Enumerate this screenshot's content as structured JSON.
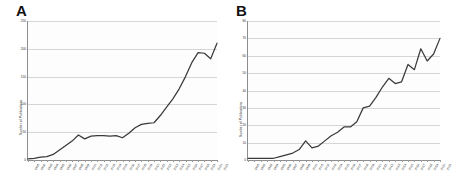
{
  "figure": {
    "panels": [
      {
        "label": "A",
        "name": "panel-a",
        "chart": {
          "type": "line",
          "title": "A",
          "xlabel": "",
          "ylabel": "Number of Publications",
          "ylim": [
            0,
            250
          ],
          "yticks": [
            0,
            50,
            100,
            150,
            200,
            250
          ],
          "ytick_labels": [
            "0",
            "50",
            "100",
            "150",
            "200",
            "250"
          ],
          "grid": true,
          "legend": "none",
          "categories": [
            "1991",
            "1992",
            "1993",
            "1994",
            "1995",
            "1996",
            "1997",
            "1998",
            "1999",
            "2000",
            "2001",
            "2002",
            "2003",
            "2004",
            "2005",
            "2006",
            "2007",
            "2008",
            "2009",
            "2010",
            "2011",
            "2012",
            "2013",
            "2014",
            "2015",
            "2016",
            "2017",
            "2018",
            "2019",
            "2020",
            "2021"
          ],
          "values": [
            2,
            3,
            5,
            6,
            10,
            18,
            26,
            34,
            45,
            38,
            43,
            44,
            44,
            43,
            44,
            40,
            48,
            58,
            64,
            66,
            67,
            80,
            95,
            110,
            128,
            150,
            175,
            193,
            192,
            182,
            210
          ]
        }
      },
      {
        "label": "B",
        "name": "panel-b",
        "chart": {
          "type": "line",
          "title": "B",
          "xlabel": "",
          "ylabel": "Number of Publications",
          "ylim": [
            0,
            80
          ],
          "yticks": [
            0,
            10,
            20,
            30,
            40,
            50,
            60,
            70,
            80
          ],
          "ytick_labels": [
            "0",
            "10",
            "20",
            "30",
            "40",
            "50",
            "60",
            "70",
            "80"
          ],
          "grid": true,
          "legend": "none",
          "categories": [
            "1991",
            "1992",
            "1993",
            "1994",
            "1995",
            "1996",
            "1997",
            "1998",
            "1999",
            "2000",
            "2001",
            "2002",
            "2003",
            "2004",
            "2005",
            "2006",
            "2007",
            "2008",
            "2009",
            "2010",
            "2011",
            "2012",
            "2013",
            "2014",
            "2015",
            "2016",
            "2017",
            "2018",
            "2019",
            "2020",
            "2021"
          ],
          "values": [
            1,
            1,
            1,
            1,
            1,
            2,
            3,
            4,
            6,
            11,
            7,
            8,
            11,
            14,
            16,
            19,
            19,
            22,
            30,
            31,
            36,
            42,
            47,
            44,
            45,
            55,
            52,
            64,
            57,
            61,
            70
          ]
        }
      }
    ]
  },
  "chart_data": [
    {
      "type": "line",
      "title": "A",
      "xlabel": "",
      "ylabel": "Number of Publications",
      "ylim": [
        0,
        250
      ],
      "yticks": [
        0,
        50,
        100,
        150,
        200,
        250
      ],
      "grid": true,
      "legend": "none",
      "categories": [
        "1991",
        "1992",
        "1993",
        "1994",
        "1995",
        "1996",
        "1997",
        "1998",
        "1999",
        "2000",
        "2001",
        "2002",
        "2003",
        "2004",
        "2005",
        "2006",
        "2007",
        "2008",
        "2009",
        "2010",
        "2011",
        "2012",
        "2013",
        "2014",
        "2015",
        "2016",
        "2017",
        "2018",
        "2019",
        "2020",
        "2021"
      ],
      "values": [
        2,
        3,
        5,
        6,
        10,
        18,
        26,
        34,
        45,
        38,
        43,
        44,
        44,
        43,
        44,
        40,
        48,
        58,
        64,
        66,
        67,
        80,
        95,
        110,
        128,
        150,
        175,
        193,
        192,
        182,
        210
      ]
    },
    {
      "type": "line",
      "title": "B",
      "xlabel": "",
      "ylabel": "Number of Publications",
      "ylim": [
        0,
        80
      ],
      "yticks": [
        0,
        10,
        20,
        30,
        40,
        50,
        60,
        70,
        80
      ],
      "grid": true,
      "legend": "none",
      "categories": [
        "1991",
        "1992",
        "1993",
        "1994",
        "1995",
        "1996",
        "1997",
        "1998",
        "1999",
        "2000",
        "2001",
        "2002",
        "2003",
        "2004",
        "2005",
        "2006",
        "2007",
        "2008",
        "2009",
        "2010",
        "2011",
        "2012",
        "2013",
        "2014",
        "2015",
        "2016",
        "2017",
        "2018",
        "2019",
        "2020",
        "2021"
      ],
      "values": [
        1,
        1,
        1,
        1,
        1,
        2,
        3,
        4,
        6,
        11,
        7,
        8,
        11,
        14,
        16,
        19,
        19,
        22,
        30,
        31,
        36,
        42,
        47,
        44,
        45,
        55,
        52,
        64,
        57,
        61,
        70
      ]
    }
  ]
}
